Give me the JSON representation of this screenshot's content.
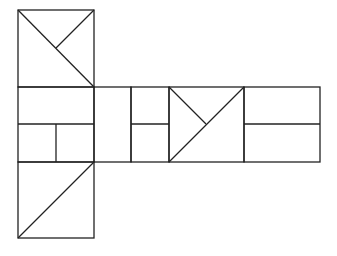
{
  "diagram": {
    "stroke_color": "#222222",
    "background": "#ffffff",
    "shapes": [
      {
        "name": "top-square",
        "x": 18,
        "y": 10,
        "w": 76,
        "h": 77
      },
      {
        "name": "middle-left-square",
        "x": 18,
        "y": 87,
        "w": 76,
        "h": 75
      },
      {
        "name": "middle-narrow-rect-1",
        "x": 94,
        "y": 87,
        "w": 37,
        "h": 75
      },
      {
        "name": "middle-narrow-rect-2",
        "x": 131,
        "y": 87,
        "w": 38,
        "h": 75
      },
      {
        "name": "middle-center-square",
        "x": 169,
        "y": 87,
        "w": 75,
        "h": 75
      },
      {
        "name": "middle-right-rect",
        "x": 244,
        "y": 87,
        "w": 76,
        "h": 75
      },
      {
        "name": "bottom-square",
        "x": 18,
        "y": 162,
        "w": 76,
        "h": 76
      }
    ],
    "lines": [
      {
        "name": "top-square-diagonal",
        "x1": 18,
        "y1": 10,
        "x2": 94,
        "y2": 87
      },
      {
        "name": "top-square-half-diagonal",
        "x1": 94,
        "y1": 10,
        "x2": 56,
        "y2": 48
      },
      {
        "name": "middle-left-horizontal",
        "x1": 18,
        "y1": 124,
        "x2": 94,
        "y2": 124
      },
      {
        "name": "middle-left-vertical",
        "x1": 56,
        "y1": 124,
        "x2": 56,
        "y2": 162
      },
      {
        "name": "narrow-rect-2-horizontal",
        "x1": 131,
        "y1": 124,
        "x2": 169,
        "y2": 124
      },
      {
        "name": "center-square-diagonal",
        "x1": 244,
        "y1": 87,
        "x2": 169,
        "y2": 162
      },
      {
        "name": "center-square-half-diagonal",
        "x1": 169,
        "y1": 87,
        "x2": 206,
        "y2": 124
      },
      {
        "name": "right-rect-horizontal",
        "x1": 244,
        "y1": 124,
        "x2": 320,
        "y2": 124
      },
      {
        "name": "bottom-square-diagonal",
        "x1": 94,
        "y1": 162,
        "x2": 18,
        "y2": 238
      }
    ]
  }
}
